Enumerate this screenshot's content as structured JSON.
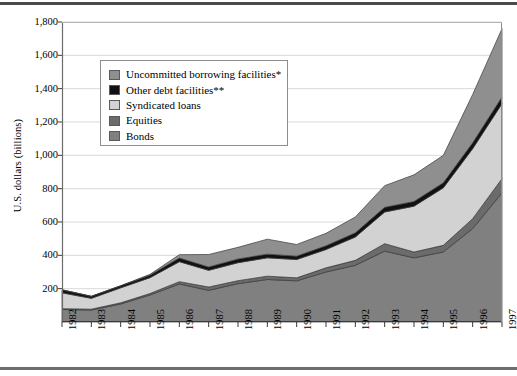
{
  "figure": {
    "y_axis_title": "U.S. dollars (billions)"
  },
  "chart_data": {
    "type": "area",
    "stacked": true,
    "title": "",
    "xlabel": "",
    "ylabel": "U.S. dollars (billions)",
    "ylim": [
      0,
      1800
    ],
    "ytick_labels": [
      "1,800",
      "1,600",
      "1,400",
      "1,200",
      "1,000",
      "800",
      "600",
      "400",
      "200"
    ],
    "ytick_values": [
      1800,
      1600,
      1400,
      1200,
      1000,
      800,
      600,
      400,
      200
    ],
    "grid": "horizontal",
    "legend_position": "upper-left-inset",
    "categories": [
      "1982",
      "1983",
      "1984",
      "1985",
      "1986",
      "1987",
      "1988",
      "1989",
      "1990",
      "1991",
      "1992",
      "1993",
      "1994",
      "1995",
      "1996",
      "1997"
    ],
    "x": [
      1982,
      1983,
      1984,
      1985,
      1986,
      1987,
      1988,
      1989,
      1990,
      1991,
      1992,
      1993,
      1994,
      1995,
      1996,
      1997
    ],
    "series": [
      {
        "name": "Bonds",
        "color": "#808080",
        "values": [
          75,
          72,
          108,
          162,
          228,
          190,
          230,
          255,
          247,
          300,
          340,
          425,
          385,
          420,
          560,
          775
        ]
      },
      {
        "name": "Equities",
        "color": "#6b6b6b",
        "values": [
          5,
          5,
          7,
          9,
          14,
          20,
          18,
          20,
          18,
          25,
          30,
          45,
          35,
          40,
          60,
          85
        ]
      },
      {
        "name": "Syndicated loans",
        "color": "#d2d2d2",
        "values": [
          95,
          65,
          90,
          95,
          120,
          100,
          108,
          110,
          110,
          110,
          140,
          190,
          275,
          345,
          420,
          450
        ]
      },
      {
        "name": "Other debt facilities**",
        "color": "#111111",
        "values": [
          18,
          12,
          12,
          15,
          22,
          20,
          22,
          22,
          20,
          22,
          25,
          28,
          28,
          30,
          35,
          40
        ]
      },
      {
        "name": "Uncommitted borrowing facilities*",
        "color": "#8f8f8f",
        "values": [
          0,
          0,
          0,
          5,
          20,
          75,
          70,
          90,
          70,
          75,
          95,
          130,
          160,
          165,
          290,
          410
        ]
      }
    ],
    "series_legend_order": [
      "Uncommitted borrowing facilities*",
      "Other debt facilities**",
      "Syndicated loans",
      "Equities",
      "Bonds"
    ],
    "totals": [
      193,
      154,
      217,
      286,
      404,
      405,
      448,
      497,
      465,
      532,
      630,
      818,
      883,
      1000,
      1365,
      1760
    ]
  },
  "legend": {
    "items": [
      {
        "label": "Uncommitted borrowing facilities*",
        "color": "#8f8f8f"
      },
      {
        "label": "Other debt facilities**",
        "color": "#111111"
      },
      {
        "label": "Syndicated loans",
        "color": "#d2d2d2"
      },
      {
        "label": "Equities",
        "color": "#6b6b6b"
      },
      {
        "label": "Bonds",
        "color": "#808080"
      }
    ]
  }
}
